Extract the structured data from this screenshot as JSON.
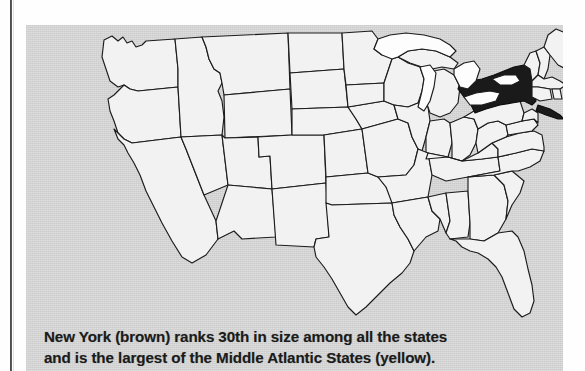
{
  "figure": {
    "kind": "map",
    "highlighted_state": "New York",
    "highlight_color_name": "brown",
    "region_color_name": "yellow",
    "region_name": "Middle Atlantic States",
    "rank_text": "30th",
    "colors": {
      "panel_background": "#d3d3d3",
      "state_fill": "#f2f2f2",
      "highlight_fill": "#1a1a1a",
      "water_fill": "#fdfdfd",
      "border_stroke": "#1c1c1c",
      "caption_text": "#1b1b1b",
      "page_background": "#fefefe",
      "gutter_line": "#2b2b2b"
    }
  },
  "caption": {
    "line1": "New York (brown) ranks 30th in size among all the states",
    "line2": "and is the largest of the Middle Atlantic States (yellow).",
    "full": "New York (brown) ranks 30th in size among all the states and is the largest of the Middle Atlantic States (yellow)."
  }
}
